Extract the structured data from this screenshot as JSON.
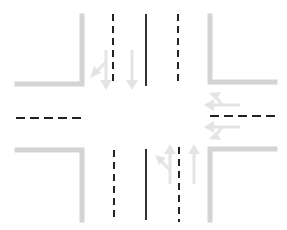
{
  "diagram": {
    "type": "intersection-lane-diagram",
    "colors": {
      "curb": "#d4d4d4",
      "lane_marking": "#222222",
      "arrow": "#e4e4e4",
      "background": "#ffffff"
    },
    "approaches": [
      {
        "name": "north",
        "arrows": [
          "straight-and-right-turn",
          "straight"
        ],
        "direction": "southbound"
      },
      {
        "name": "east",
        "arrows": [
          "straight-and-left-turn",
          "straight-and-right-turn"
        ],
        "direction": "westbound"
      },
      {
        "name": "south",
        "arrows": [
          "straight-and-left-turn",
          "straight"
        ],
        "direction": "northbound"
      },
      {
        "name": "west",
        "arrows": [],
        "direction": "eastbound"
      }
    ]
  }
}
